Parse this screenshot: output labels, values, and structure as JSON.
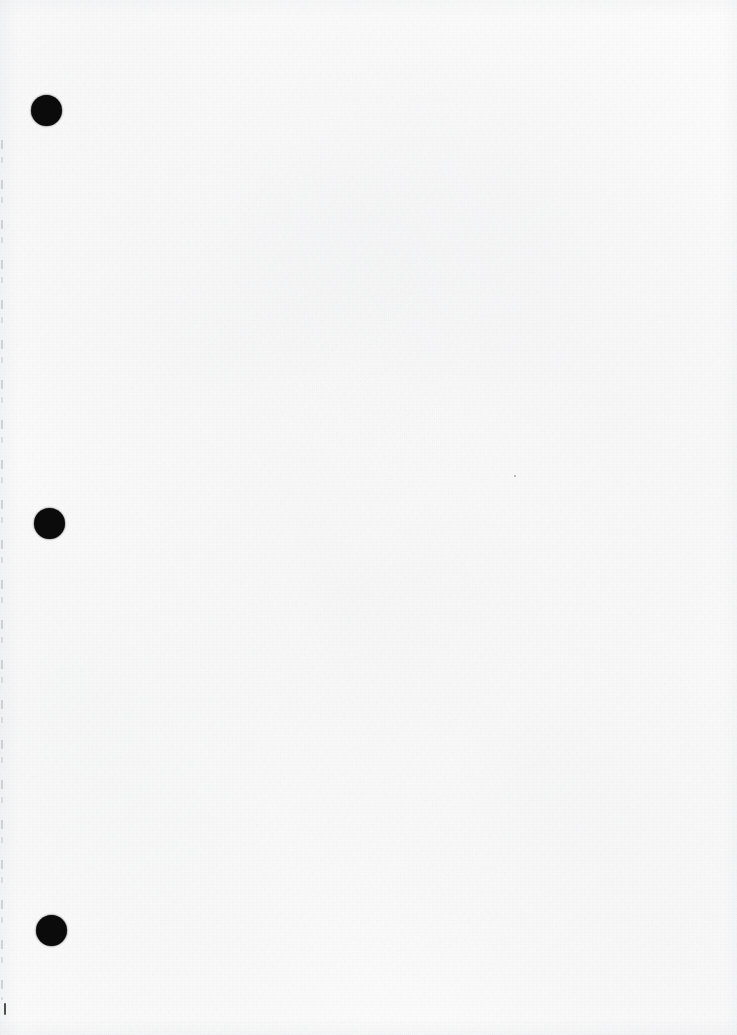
{
  "document": {
    "kind": "scanned-page",
    "content_text": "",
    "page_width": 737,
    "page_height": 1035,
    "background_color": "#fbfbfb",
    "ink_color": "#0b0b0b",
    "is_blank": true,
    "note": ""
  },
  "binder_holes": [
    {
      "label": "hole-1",
      "cx": 46.5,
      "cy": 110.5,
      "diameter": 31
    },
    {
      "label": "hole-2",
      "cx": 49.5,
      "cy": 523.5,
      "diameter": 31
    },
    {
      "label": "hole-3",
      "cx": 51.5,
      "cy": 930.5,
      "diameter": 31
    }
  ],
  "artifacts": {
    "edge_line": {
      "label": "left-edge-scan-line",
      "x": 1,
      "y": 140,
      "height": 860,
      "color": "#787c86"
    },
    "corner_tick": {
      "label": "bottom-left-tick",
      "x": 4,
      "y": 1003,
      "width": 2,
      "height": 12,
      "color": "#2a2a2a"
    },
    "speck": {
      "label": "dust-speck",
      "x": 514,
      "y": 475,
      "size": 2,
      "color": "#8d9199"
    }
  }
}
